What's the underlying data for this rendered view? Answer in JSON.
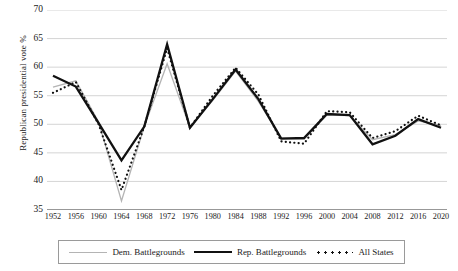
{
  "chart_data": {
    "type": "line",
    "title": "",
    "xlabel": "",
    "ylabel": "Republican presidential vote %",
    "x": [
      1952,
      1956,
      1960,
      1964,
      1968,
      1972,
      1976,
      1980,
      1984,
      1988,
      1992,
      1996,
      2000,
      2004,
      2008,
      2012,
      2016,
      2020
    ],
    "categories": [
      "1952",
      "1956",
      "1960",
      "1964",
      "1968",
      "1972",
      "1976",
      "1980",
      "1984",
      "1988",
      "1992",
      "1996",
      "2000",
      "2004",
      "2008",
      "2012",
      "2016",
      "2020"
    ],
    "ylim": [
      35,
      70
    ],
    "yticks": [
      35,
      40,
      45,
      50,
      55,
      60,
      65,
      70
    ],
    "grid": "horizontal",
    "legend_position": "bottom",
    "series": [
      {
        "name": "Dem. Battlegrounds",
        "style": "thin-solid",
        "color": "#b4b4b4",
        "values": [
          56.5,
          57.6,
          50.4,
          36.6,
          49.6,
          60.6,
          49.4,
          54.2,
          59.3,
          54.0,
          47.6,
          47.4,
          51.6,
          51.5,
          47.3,
          48.2,
          50.6,
          49.8
        ]
      },
      {
        "name": "Rep. Battlegrounds",
        "style": "thick-solid",
        "color": "#111111",
        "values": [
          58.5,
          56.6,
          50.2,
          43.7,
          49.6,
          64.0,
          49.4,
          54.4,
          59.6,
          54.4,
          47.5,
          47.6,
          51.8,
          51.6,
          46.5,
          48.0,
          50.9,
          49.4
        ]
      },
      {
        "name": "All States",
        "style": "dotted",
        "color": "#111111",
        "values": [
          55.5,
          57.4,
          50.0,
          38.5,
          49.6,
          63.3,
          49.4,
          55.0,
          59.9,
          55.2,
          47.0,
          46.6,
          52.3,
          52.1,
          47.6,
          48.8,
          51.5,
          49.8
        ]
      }
    ]
  },
  "legend": {
    "items": [
      {
        "label": "Dem. Battlegrounds",
        "swatch": "thin-line-swatch"
      },
      {
        "label": "Rep. Battlegrounds",
        "swatch": "thick-line-swatch"
      },
      {
        "label": "All States",
        "swatch": "dotted-line-swatch"
      }
    ]
  }
}
